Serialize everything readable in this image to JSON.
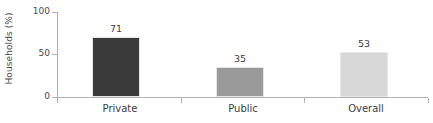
{
  "chart_data": {
    "type": "bar",
    "title": "",
    "subtitle": "",
    "xlabel": "",
    "ylabel": "Households (%)",
    "categories": [
      "Private",
      "Public",
      "Overall"
    ],
    "values": [
      71,
      35,
      53
    ],
    "value_labels": [
      "71",
      "35",
      "53"
    ],
    "ylim": [
      0,
      100
    ],
    "y_ticks": [
      0,
      50,
      100
    ],
    "y_tick_labels": [
      "0",
      "50",
      "100"
    ],
    "grid": false,
    "legend": false,
    "legend_position": "none",
    "bar_colors": [
      "#3a3a3a",
      "#9a9a9a",
      "#d8d8d8"
    ],
    "bar_border_color": "#e6e6e6",
    "axis_color": "#b0b0b0",
    "text_color": "#3d3d3d",
    "background": "#ffffff"
  }
}
